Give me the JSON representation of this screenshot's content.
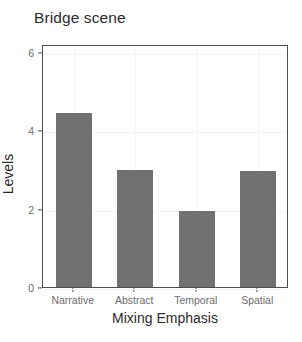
{
  "chart_data": {
    "type": "bar",
    "title": "Bridge scene",
    "xlabel": "Mixing Emphasis",
    "ylabel": "Levels",
    "categories": [
      "Narrative",
      "Abstract",
      "Temporal",
      "Spatial"
    ],
    "values": [
      4.45,
      2.98,
      1.95,
      2.95
    ],
    "ylim": [
      0,
      6.2
    ],
    "yticks": [
      0,
      2,
      4,
      6
    ],
    "ytick_labels": [
      "0",
      "2",
      "4",
      "6"
    ],
    "grid": true,
    "legend": null,
    "bar_color": "#717171",
    "panel_border_color": "#4d4d4d",
    "gridline_color": "#f3f3f3",
    "title_color": "#2b2b2b",
    "tick_label_color": "#6b6b6b",
    "axis_label_color": "#2b2b2b"
  }
}
